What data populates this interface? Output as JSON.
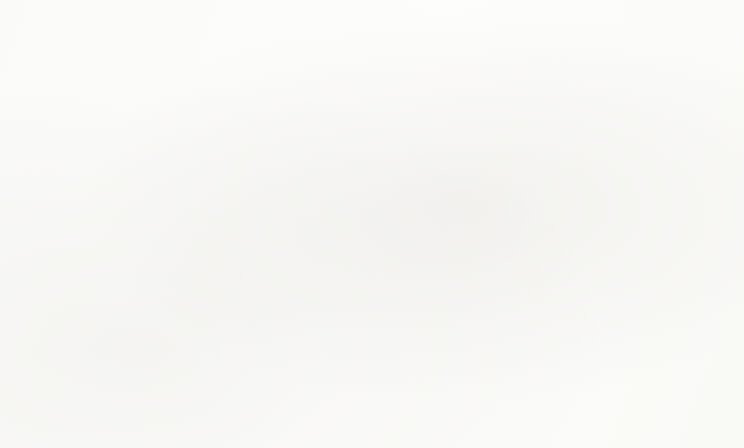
{
  "chart_data": {
    "type": "line",
    "title": "",
    "xlabel": "",
    "ylabel": "Concentration (µg/m³)",
    "x": [
      2000,
      2001,
      2002,
      2003,
      2004,
      2005,
      2006,
      2007,
      2008,
      2009,
      2010,
      2011,
      2012,
      2013,
      2014,
      2015,
      2016,
      2017
    ],
    "categories": [
      "2000",
      "2001",
      "2002",
      "2003",
      "2004",
      "2005",
      "2006",
      "2007",
      "2008",
      "2009",
      "2010",
      "2011",
      "2012",
      "2013",
      "2014",
      "2015",
      "2016",
      "2017"
    ],
    "xlim": [
      2000,
      2017
    ],
    "ylim": [
      0.0,
      25.0
    ],
    "ytick_labels": [
      "0.0",
      "5.0",
      "10.0",
      "15.0",
      "20.0",
      "25.0"
    ],
    "ytick_values": [
      0.0,
      5.0,
      10.0,
      15.0,
      20.0,
      25.0
    ],
    "grid": true,
    "legend_position": "lower-left-inside",
    "series": [
      {
        "name": "Liberty",
        "color": "#585858",
        "marker": "square",
        "values": [
          20.9,
          23.1,
          20.4,
          20.2,
          20.3,
          21.4,
          19.2,
          18.9,
          17.0,
          15.1,
          16.2,
          14.2,
          14.3,
          12.1,
          12.8,
          12.7,
          12.8,
          13.5
        ]
      },
      {
        "name": "Avalon",
        "color": "#4d4d4d",
        "marker": "diamond",
        "values": [
          14.0,
          14.0,
          13.2,
          13.5,
          12.7,
          13.6,
          13.5,
          13.4,
          12.0,
          11.6,
          12.8,
          11.2,
          9.3,
          9.7,
          10.0,
          10.8,
          9.7,
          10.6
        ]
      },
      {
        "name": "North Braddock",
        "color": "#8a8a8a",
        "marker": "square",
        "values": [
          16.4,
          17.1,
          16.8,
          17.0,
          15.7,
          17.1,
          15.2,
          16.6,
          14.6,
          15.1,
          15.2,
          13.3,
          12.2,
          11.6,
          11.6,
          11.4,
          10.7,
          11.2
        ]
      },
      {
        "name": "Harrison",
        "color": "#b6b6b6",
        "marker": "triangle",
        "values": [
          15.8,
          16.0,
          15.9,
          15.6,
          15.3,
          15.0,
          14.2,
          14.9,
          13.8,
          12.3,
          13.6,
          12.2,
          11.3,
          10.4,
          10.6,
          10.5,
          9.8,
          10.6
        ]
      },
      {
        "name": "Lawrenceville",
        "color": "#c4c4c4",
        "marker": "none",
        "values": [
          15.8,
          16.0,
          15.8,
          15.6,
          15.2,
          15.1,
          14.2,
          15.0,
          13.5,
          12.4,
          13.6,
          12.3,
          11.4,
          10.5,
          10.6,
          10.6,
          10.0,
          10.8
        ]
      },
      {
        "name": "Clairton",
        "color": "#6b6b6b",
        "marker": "dash",
        "values": [
          18.8,
          18.8,
          16.0,
          17.0,
          15.7,
          15.9,
          15.0,
          13.3,
          14.2,
          14.8,
          15.2,
          13.2,
          11.3,
          10.6,
          11.1,
          11.5,
          10.4,
          11.2
        ]
      },
      {
        "name": "South Fayette",
        "color": "#3d3d3d",
        "marker": "diamond",
        "values": [
          14.0,
          14.0,
          12.2,
          12.8,
          12.2,
          13.2,
          12.4,
          12.2,
          11.0,
          9.7,
          11.7,
          10.5,
          9.2,
          8.9,
          9.5,
          10.2,
          8.1,
          8.9
        ]
      },
      {
        "name": "North Park",
        "color": "#7e7e7e",
        "marker": "dash",
        "values": [
          14.0,
          14.0,
          13.8,
          13.0,
          12.7,
          12.5,
          11.2,
          11.5,
          10.9,
          10.9,
          11.6,
          10.5,
          9.2,
          9.1,
          9.4,
          9.4,
          8.1,
          8.9
        ]
      },
      {
        "name": "Parkway East",
        "color": "#c9c9c9",
        "marker": "none",
        "values": [
          15.8,
          16.0,
          15.8,
          15.6,
          15.2,
          15.0,
          14.1,
          14.8,
          13.6,
          12.2,
          13.5,
          12.2,
          11.3,
          10.4,
          10.5,
          10.4,
          9.8,
          10.5
        ]
      }
    ],
    "reference_lines": [
      {
        "name": "EPA Standard (12.0 µg/m³)",
        "short_name": "EPA Standard",
        "value": 12.0,
        "color": "#3a3a3a",
        "style": "step",
        "step_from_year": 2013,
        "prior_value": 15.0
      },
      {
        "name": "Former EPA Standard (15.0 µg/m³)",
        "short_name": "Former EPA Standard",
        "value": 15.0,
        "color": "#5a5a5a",
        "style": "solid",
        "end_year": 2012
      }
    ],
    "legend_entries": [
      "Liberty",
      "Avalon",
      "North Braddock",
      "Harrison",
      "Lawrenceville",
      "Clairton",
      "South Fayette",
      "North Park",
      "Parkway East",
      "EPA Standard (12.0 µg/m³)",
      "Former EPA Standard (15.0 µg/m³)"
    ]
  }
}
